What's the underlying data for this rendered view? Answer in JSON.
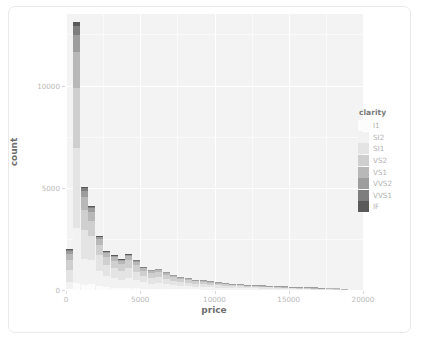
{
  "chart_data": {
    "type": "bar",
    "subtype": "stacked-histogram",
    "title": "",
    "xlabel": "price",
    "ylabel": "count",
    "xlim": [
      0,
      20000
    ],
    "ylim": [
      0,
      13500
    ],
    "xticks": [
      0,
      5000,
      10000,
      15000,
      20000
    ],
    "xtick_labels": [
      "0",
      "5000",
      "10000",
      "15000",
      "20000"
    ],
    "yticks": [
      0,
      5000,
      10000
    ],
    "ytick_labels": [
      "0",
      "5000",
      "10000"
    ],
    "grid": true,
    "grid_color": "#ffffff",
    "panel_background": "#f3f3f3",
    "legend": {
      "title": "clarity",
      "position": "right",
      "entries": [
        {
          "label": "I1",
          "color": "#fcfcfc"
        },
        {
          "label": "SI2",
          "color": "#f2f2f2"
        },
        {
          "label": "SI1",
          "color": "#e4e4e4"
        },
        {
          "label": "VS2",
          "color": "#cfcfcf"
        },
        {
          "label": "VS1",
          "color": "#b8b8b8"
        },
        {
          "label": "VVS2",
          "color": "#9d9d9d"
        },
        {
          "label": "VVS1",
          "color": "#7e7e7e"
        },
        {
          "label": "IF",
          "color": "#5a5a5a"
        }
      ]
    },
    "series": [
      {
        "name": "I1",
        "color": "#fcfcfc"
      },
      {
        "name": "SI2",
        "color": "#f2f2f2"
      },
      {
        "name": "SI1",
        "color": "#e4e4e4"
      },
      {
        "name": "VS2",
        "color": "#cfcfcf"
      },
      {
        "name": "VS1",
        "color": "#b8b8b8"
      },
      {
        "name": "VVS2",
        "color": "#9d9d9d"
      },
      {
        "name": "VVS1",
        "color": "#7e7e7e"
      },
      {
        "name": "IF",
        "color": "#5a5a5a"
      }
    ],
    "bin_width": 500,
    "bins": [
      {
        "x0": 0,
        "x1": 500,
        "total": 2000,
        "values": [
          40,
          360,
          600,
          480,
          300,
          130,
          60,
          30
        ]
      },
      {
        "x0": 500,
        "x1": 1000,
        "total": 13100,
        "values": [
          330,
          2700,
          3900,
          2950,
          1750,
          850,
          420,
          200
        ]
      },
      {
        "x0": 1000,
        "x1": 1500,
        "total": 5050,
        "values": [
          260,
          1250,
          1450,
          960,
          640,
          280,
          130,
          80
        ]
      },
      {
        "x0": 1500,
        "x1": 2000,
        "total": 4100,
        "values": [
          300,
          1150,
          1200,
          740,
          440,
          180,
          60,
          30
        ]
      },
      {
        "x0": 2000,
        "x1": 2500,
        "total": 2650,
        "values": [
          190,
          750,
          780,
          500,
          290,
          100,
          30,
          10
        ]
      },
      {
        "x0": 2500,
        "x1": 3000,
        "total": 1900,
        "values": [
          140,
          540,
          560,
          360,
          210,
          70,
          15,
          5
        ]
      },
      {
        "x0": 3000,
        "x1": 3500,
        "total": 1700,
        "values": [
          120,
          470,
          500,
          330,
          200,
          65,
          10,
          5
        ]
      },
      {
        "x0": 3500,
        "x1": 4000,
        "total": 1500,
        "values": [
          100,
          410,
          440,
          300,
          180,
          55,
          10,
          5
        ]
      },
      {
        "x0": 4000,
        "x1": 4500,
        "total": 1750,
        "values": [
          110,
          470,
          510,
          360,
          210,
          70,
          15,
          5
        ]
      },
      {
        "x0": 4500,
        "x1": 5000,
        "total": 1450,
        "values": [
          90,
          390,
          420,
          300,
          180,
          58,
          10,
          2
        ]
      },
      {
        "x0": 5000,
        "x1": 5500,
        "total": 1150,
        "values": [
          70,
          300,
          330,
          250,
          150,
          45,
          5,
          0
        ]
      },
      {
        "x0": 5500,
        "x1": 6000,
        "total": 980,
        "values": [
          60,
          250,
          280,
          220,
          130,
          38,
          2,
          0
        ]
      },
      {
        "x0": 6000,
        "x1": 6500,
        "total": 1050,
        "values": [
          62,
          270,
          300,
          238,
          140,
          38,
          2,
          0
        ]
      },
      {
        "x0": 6500,
        "x1": 7000,
        "total": 900,
        "values": [
          52,
          230,
          260,
          205,
          120,
          32,
          1,
          0
        ]
      },
      {
        "x0": 7000,
        "x1": 7500,
        "total": 760,
        "values": [
          44,
          195,
          220,
          172,
          100,
          28,
          1,
          0
        ]
      },
      {
        "x0": 7500,
        "x1": 8000,
        "total": 660,
        "values": [
          38,
          168,
          190,
          150,
          88,
          25,
          1,
          0
        ]
      },
      {
        "x0": 8000,
        "x1": 8500,
        "total": 580,
        "values": [
          32,
          148,
          168,
          132,
          78,
          21,
          1,
          0
        ]
      },
      {
        "x0": 8500,
        "x1": 9000,
        "total": 510,
        "values": [
          28,
          130,
          148,
          116,
          69,
          18,
          1,
          0
        ]
      },
      {
        "x0": 9000,
        "x1": 9500,
        "total": 470,
        "values": [
          25,
          120,
          136,
          107,
          64,
          17,
          1,
          0
        ]
      },
      {
        "x0": 9500,
        "x1": 10000,
        "total": 420,
        "values": [
          22,
          107,
          122,
          96,
          57,
          15,
          1,
          0
        ]
      },
      {
        "x0": 10000,
        "x1": 10500,
        "total": 380,
        "values": [
          20,
          97,
          110,
          87,
          52,
          13,
          1,
          0
        ]
      },
      {
        "x0": 10500,
        "x1": 11000,
        "total": 350,
        "values": [
          18,
          89,
          101,
          80,
          48,
          13,
          1,
          0
        ]
      },
      {
        "x0": 11000,
        "x1": 11500,
        "total": 320,
        "values": [
          16,
          81,
          93,
          73,
          44,
          12,
          1,
          0
        ]
      },
      {
        "x0": 11500,
        "x1": 12000,
        "total": 295,
        "values": [
          15,
          75,
          86,
          68,
          40,
          10,
          1,
          0
        ]
      },
      {
        "x0": 12000,
        "x1": 12500,
        "total": 270,
        "values": [
          13,
          69,
          78,
          62,
          37,
          10,
          1,
          0
        ]
      },
      {
        "x0": 12500,
        "x1": 13000,
        "total": 250,
        "values": [
          12,
          64,
          73,
          57,
          34,
          9,
          1,
          0
        ]
      },
      {
        "x0": 13000,
        "x1": 13500,
        "total": 230,
        "values": [
          11,
          59,
          67,
          53,
          31,
          8,
          1,
          0
        ]
      },
      {
        "x0": 13500,
        "x1": 14000,
        "total": 210,
        "values": [
          10,
          54,
          61,
          48,
          29,
          8,
          0,
          0
        ]
      },
      {
        "x0": 14000,
        "x1": 14500,
        "total": 195,
        "values": [
          9,
          50,
          57,
          45,
          27,
          7,
          0,
          0
        ]
      },
      {
        "x0": 14500,
        "x1": 15000,
        "total": 180,
        "values": [
          8,
          46,
          52,
          41,
          25,
          7,
          0,
          0
        ]
      },
      {
        "x0": 15000,
        "x1": 15500,
        "total": 165,
        "values": [
          8,
          42,
          48,
          38,
          23,
          6,
          0,
          0
        ]
      },
      {
        "x0": 15500,
        "x1": 16000,
        "total": 150,
        "values": [
          7,
          38,
          44,
          34,
          21,
          6,
          0,
          0
        ]
      },
      {
        "x0": 16000,
        "x1": 16500,
        "total": 140,
        "values": [
          6,
          36,
          41,
          32,
          19,
          6,
          0,
          0
        ]
      },
      {
        "x0": 16500,
        "x1": 17000,
        "total": 125,
        "values": [
          6,
          32,
          36,
          29,
          17,
          5,
          0,
          0
        ]
      },
      {
        "x0": 17000,
        "x1": 17500,
        "total": 115,
        "values": [
          5,
          29,
          34,
          26,
          16,
          5,
          0,
          0
        ]
      },
      {
        "x0": 17500,
        "x1": 18000,
        "total": 100,
        "values": [
          5,
          26,
          29,
          23,
          14,
          3,
          0,
          0
        ]
      },
      {
        "x0": 18000,
        "x1": 18500,
        "total": 85,
        "values": [
          4,
          22,
          25,
          19,
          12,
          3,
          0,
          0
        ]
      },
      {
        "x0": 18500,
        "x1": 19000,
        "total": 60,
        "values": [
          3,
          15,
          17,
          14,
          9,
          2,
          0,
          0
        ]
      }
    ]
  }
}
